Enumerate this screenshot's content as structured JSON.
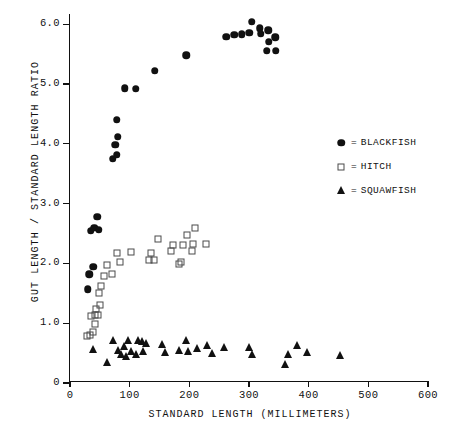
{
  "chart_data": {
    "type": "scatter",
    "title": "",
    "xlabel": "STANDARD LENGTH (MILLIMETERS)",
    "ylabel": "GUT LENGTH / STANDARD LENGTH RATIO",
    "xlim": [
      0,
      620
    ],
    "ylim": [
      0,
      6.25
    ],
    "xticks": [
      0,
      100,
      200,
      300,
      400,
      500,
      600
    ],
    "xtick_labels": [
      "0",
      "100",
      "200",
      "300",
      "400",
      "500",
      "600"
    ],
    "yticks": [
      0,
      1.0,
      2.0,
      3.0,
      4.0,
      5.0,
      6.0
    ],
    "ytick_labels": [
      "0",
      "1.0",
      "2.0",
      "3.0",
      "4.0",
      "5.0",
      "6.0"
    ],
    "grid": false,
    "legend_position": "right",
    "series": [
      {
        "name": "BLACKFISH",
        "marker": "filled-circle",
        "color": "#111111",
        "points": [
          [
            30,
            1.57
          ],
          [
            32,
            1.82
          ],
          [
            39,
            1.94
          ],
          [
            35,
            2.55
          ],
          [
            41,
            2.6
          ],
          [
            46,
            2.78
          ],
          [
            48,
            2.56
          ],
          [
            72,
            3.75
          ],
          [
            78,
            3.82
          ],
          [
            76,
            3.98
          ],
          [
            80,
            4.12
          ],
          [
            78,
            4.4
          ],
          [
            92,
            4.93
          ],
          [
            110,
            4.92
          ],
          [
            142,
            5.22
          ],
          [
            195,
            5.48
          ],
          [
            262,
            5.79
          ],
          [
            275,
            5.82
          ],
          [
            288,
            5.83
          ],
          [
            300,
            5.86
          ],
          [
            305,
            6.04
          ],
          [
            318,
            5.93
          ],
          [
            320,
            5.84
          ],
          [
            332,
            5.9
          ],
          [
            333,
            5.71
          ],
          [
            330,
            5.56
          ],
          [
            344,
            5.78
          ],
          [
            345,
            5.56
          ]
        ]
      },
      {
        "name": "HITCH",
        "marker": "open-square",
        "color": "#4a4a4a",
        "points": [
          [
            28,
            0.79
          ],
          [
            33,
            0.8
          ],
          [
            38,
            0.86
          ],
          [
            42,
            0.98
          ],
          [
            36,
            1.12
          ],
          [
            42,
            1.13
          ],
          [
            47,
            1.14
          ],
          [
            44,
            1.23
          ],
          [
            50,
            1.31
          ],
          [
            48,
            1.5
          ],
          [
            52,
            1.62
          ],
          [
            57,
            1.79
          ],
          [
            62,
            1.98
          ],
          [
            70,
            1.82
          ],
          [
            78,
            2.18
          ],
          [
            84,
            2.02
          ],
          [
            102,
            2.19
          ],
          [
            132,
            2.05
          ],
          [
            136,
            2.17
          ],
          [
            140,
            2.06
          ],
          [
            148,
            2.41
          ],
          [
            170,
            2.2
          ],
          [
            172,
            2.31
          ],
          [
            182,
            1.99
          ],
          [
            186,
            2.02
          ],
          [
            190,
            2.3
          ],
          [
            196,
            2.47
          ],
          [
            204,
            2.2
          ],
          [
            206,
            2.32
          ],
          [
            210,
            2.6
          ],
          [
            228,
            2.33
          ]
        ]
      },
      {
        "name": "SQUAWFISH",
        "marker": "filled-triangle",
        "color": "#111111",
        "points": [
          [
            38,
            0.55
          ],
          [
            62,
            0.34
          ],
          [
            72,
            0.7
          ],
          [
            80,
            0.53
          ],
          [
            86,
            0.46
          ],
          [
            90,
            0.6
          ],
          [
            94,
            0.44
          ],
          [
            98,
            0.7
          ],
          [
            103,
            0.52
          ],
          [
            110,
            0.47
          ],
          [
            114,
            0.7
          ],
          [
            120,
            0.68
          ],
          [
            122,
            0.52
          ],
          [
            128,
            0.65
          ],
          [
            155,
            0.64
          ],
          [
            160,
            0.5
          ],
          [
            182,
            0.53
          ],
          [
            194,
            0.7
          ],
          [
            198,
            0.52
          ],
          [
            212,
            0.57
          ],
          [
            230,
            0.62
          ],
          [
            238,
            0.48
          ],
          [
            258,
            0.59
          ],
          [
            300,
            0.59
          ],
          [
            305,
            0.46
          ],
          [
            360,
            0.3
          ],
          [
            365,
            0.47
          ],
          [
            380,
            0.62
          ],
          [
            398,
            0.5
          ],
          [
            452,
            0.45
          ]
        ]
      }
    ]
  },
  "legend": {
    "equals": "=",
    "entries": [
      {
        "label": "BLACKFISH",
        "marker": "filled-circle"
      },
      {
        "label": "HITCH",
        "marker": "open-square"
      },
      {
        "label": "SQUAWFISH",
        "marker": "filled-triangle"
      }
    ]
  }
}
